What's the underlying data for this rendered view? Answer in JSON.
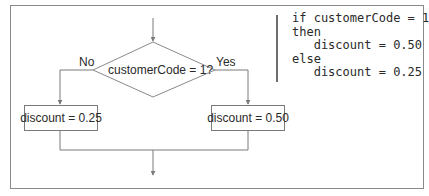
{
  "diagram": {
    "type": "flowchart",
    "decision": {
      "label": "customerCode = 1?"
    },
    "branches": {
      "no": {
        "label": "No",
        "action": "discount = 0.25"
      },
      "yes": {
        "label": "Yes",
        "action": "discount = 0.50"
      }
    },
    "colors": {
      "line": "#7a7a7a",
      "text": "#2a2a2a",
      "frame": "#8a8a8a"
    }
  },
  "pseudocode": {
    "lines": [
      "if customerCode = 1",
      "then",
      "   discount = 0.50",
      "else",
      "   discount = 0.25"
    ]
  }
}
